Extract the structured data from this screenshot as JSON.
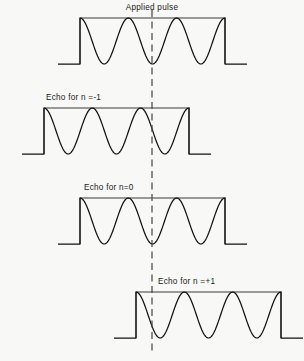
{
  "figure": {
    "background_color": "#f8f8f6",
    "line_color": "#111111",
    "envelope_color": "#3a3a3a",
    "reference_line_color": "#4a4a4a",
    "width": 304,
    "height": 361,
    "reference_line": {
      "label": "reference-time-axis",
      "x": 152,
      "y_top": 10,
      "y_bottom": 352,
      "dash": "7 4.5"
    }
  },
  "chart_data": {
    "type": "line",
    "title": "",
    "xlabel": "",
    "ylabel": "",
    "grid": false,
    "legend_position": "none",
    "annotations": [
      "Applied pulse",
      "Echo for n =-1",
      "Echo for n=0",
      "Echo for n =+1"
    ],
    "reference_line_x": 152,
    "series": [
      {
        "name": "Applied pulse",
        "label": "Applied pulse",
        "label_x": 152,
        "label_y": 10,
        "label_anchor": "middle",
        "baseline_y": 64,
        "envelope_top_y": 18,
        "envelope_left_x": 80,
        "envelope_right_x": 225,
        "trace_left_x": 58,
        "trace_right_x": 247,
        "cycles": 3,
        "peaks_x": [
          96,
          152,
          209
        ],
        "reference_hits_peak_index": 1,
        "shift_px": 0
      },
      {
        "name": "Echo for n = -1",
        "label": "Echo for n =-1",
        "label_x": 46,
        "label_y": 100,
        "label_anchor": "start",
        "baseline_y": 154,
        "envelope_top_y": 108,
        "envelope_left_x": 44,
        "envelope_right_x": 189,
        "trace_left_x": 22,
        "trace_right_x": 211,
        "cycles": 3,
        "peaks_x": [
          60,
          116,
          173
        ],
        "reference_hits_peak_index": 2,
        "shift_px": -36
      },
      {
        "name": "Echo for n = 0",
        "label": "Echo for n=0",
        "label_x": 84,
        "label_y": 190,
        "label_anchor": "start",
        "baseline_y": 244,
        "envelope_top_y": 198,
        "envelope_left_x": 80,
        "envelope_right_x": 225,
        "trace_left_x": 58,
        "trace_right_x": 247,
        "cycles": 3,
        "peaks_x": [
          96,
          152,
          209
        ],
        "reference_hits_peak_index": 1,
        "shift_px": 0
      },
      {
        "name": "Echo for n = +1",
        "label": "Echo for n =+1",
        "label_x": 158,
        "label_y": 284,
        "label_anchor": "start",
        "baseline_y": 338,
        "envelope_top_y": 292,
        "envelope_left_x": 136,
        "envelope_right_x": 281,
        "trace_left_x": 114,
        "trace_right_x": 303,
        "cycles": 3,
        "peaks_x": [
          152,
          208,
          265
        ],
        "reference_hits_peak_index": 0,
        "shift_px": 56
      }
    ]
  }
}
